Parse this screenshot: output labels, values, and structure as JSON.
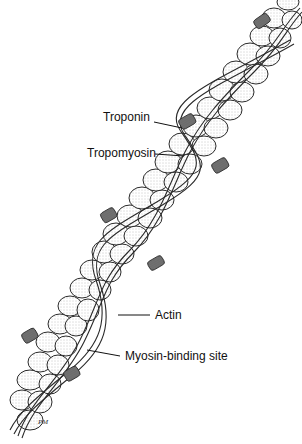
{
  "diagram": {
    "stroke_color": "#2a2a2a",
    "actin_fill": "#ffffff",
    "troponin_fill": "#6e6e6e",
    "labels": [
      {
        "id": "troponin",
        "text": "Troponin"
      },
      {
        "id": "tropomyosin",
        "text": "Tropomyosin"
      },
      {
        "id": "actin",
        "text": "Actin"
      },
      {
        "id": "myosin_binding_site",
        "text": "Myosin-binding site"
      }
    ],
    "signature": "PM"
  }
}
